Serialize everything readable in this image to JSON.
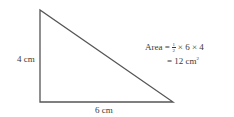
{
  "diagram": {
    "type": "right-triangle",
    "vertices": {
      "top": [
        40,
        10
      ],
      "right_angle": [
        40,
        102
      ],
      "right": [
        173,
        102
      ]
    },
    "stroke_color": "#555555",
    "labels": {
      "height": "4 cm",
      "base": "6 cm"
    },
    "formula": {
      "line1_prefix": "Area = ",
      "fraction_numerator": "1",
      "fraction_denominator": "2",
      "line1_suffix": " × 6 × 4",
      "line2_prefix": "= 12 cm",
      "line2_exponent": "2"
    }
  }
}
